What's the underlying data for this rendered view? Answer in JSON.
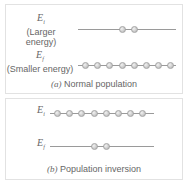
{
  "panel_a": {
    "upper_level": {
      "symbol": "E",
      "subscript": "i",
      "description": "(Larger energy)",
      "particles": 2
    },
    "lower_level": {
      "symbol": "E",
      "subscript": "f",
      "description": "(Smaller energy)",
      "particles": 8
    },
    "caption_letter": "(a)",
    "caption_text": "Normal population"
  },
  "panel_b": {
    "upper_level": {
      "symbol": "E",
      "subscript": "i",
      "particles": 8
    },
    "lower_level": {
      "symbol": "E",
      "subscript": "f",
      "particles": 2
    },
    "caption_letter": "(b)",
    "caption_text": "Population inversion"
  },
  "colors": {
    "line": "#9a9a9a",
    "particle": "#c4c4c4",
    "border": "#e2e2e2",
    "text": "#666666"
  }
}
